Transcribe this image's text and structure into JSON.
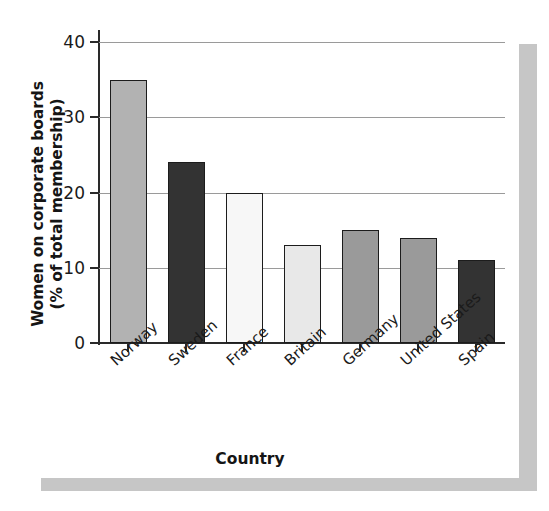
{
  "chart_data": {
    "type": "bar",
    "title": "",
    "xlabel": "Country",
    "ylabel_line1": "Women on corporate boards",
    "ylabel_line2": "(% of total membership)",
    "ylabel": "Women on corporate boards (% of total membership)",
    "categories": [
      "Norway",
      "Sweden",
      "France",
      "Britain",
      "Germany",
      "United States",
      "Spain"
    ],
    "values": [
      35,
      24,
      20,
      13,
      15,
      14,
      11
    ],
    "bar_colors": [
      "#b2b2b2",
      "#333333",
      "#f7f7f7",
      "#e8e8e8",
      "#9a9a9a",
      "#9a9a9a",
      "#333333"
    ],
    "ylim": [
      0,
      40
    ],
    "yticks": [
      0,
      10,
      20,
      30,
      40
    ],
    "ytick_labels": [
      "0",
      "10",
      "20",
      "30",
      "40"
    ],
    "grid": true,
    "grid_axis": "y",
    "legend": "none",
    "bar_edge_color": "#1c1c1c",
    "axis_color": "#2a2a2a",
    "gridline_color": "#9a9a9a",
    "background": "#ffffff"
  },
  "decor": {
    "scan_band_color": "#c6c6c6"
  }
}
